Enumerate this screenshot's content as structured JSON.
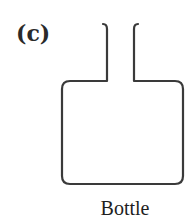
{
  "figure": {
    "panel_label": "(c)",
    "caption": "Bottle",
    "stroke_color": "#3a3a3a",
    "object": "bottle-outline"
  }
}
